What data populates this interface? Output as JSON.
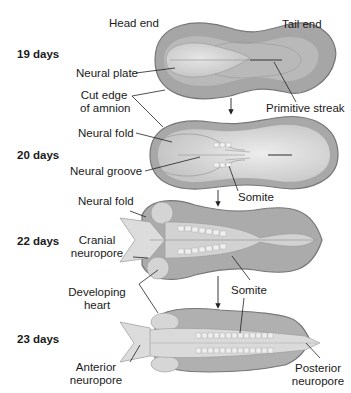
{
  "figure": {
    "orientation": {
      "head": "Head end",
      "tail": "Tail end"
    },
    "stages": [
      {
        "day_label": "19 days",
        "labels": [
          "Neural plate",
          "Cut edge of amnion",
          "Primitive streak"
        ]
      },
      {
        "day_label": "20 days",
        "labels": [
          "Neural fold",
          "Neural groove",
          "Somite"
        ]
      },
      {
        "day_label": "22 days",
        "labels": [
          "Neural fold",
          "Cranial neuropore",
          "Developing heart",
          "Somite"
        ]
      },
      {
        "day_label": "23 days",
        "labels": [
          "Anterior neuropore",
          "Somite",
          "Posterior neuropore"
        ]
      }
    ],
    "text": {
      "head_end": "Head end",
      "tail_end": "Tail end",
      "d19": "19 days",
      "d20": "20 days",
      "d22": "22 days",
      "d23": "23 days",
      "neural_plate": "Neural plate",
      "cut_edge_1": "Cut edge",
      "cut_edge_2": "of amnion",
      "primitive_streak": "Primitive streak",
      "neural_fold_20": "Neural fold",
      "neural_groove": "Neural groove",
      "somite_20": "Somite",
      "neural_fold_22": "Neural fold",
      "cranial_1": "Cranial",
      "cranial_2": "neuropore",
      "somite_22": "Somite",
      "heart_1": "Developing",
      "heart_2": "heart",
      "somite_23": "Somite",
      "anterior_1": "Anterior",
      "anterior_2": "neuropore",
      "posterior_1": "Posterior",
      "posterior_2": "neuropore"
    },
    "colors": {
      "amnion_edge": "#8a8a8a",
      "outer_body": "#a9a9a9",
      "inner_plate": "#d9d9d9",
      "highlight": "#ececec",
      "leader_line": "#222222"
    }
  }
}
